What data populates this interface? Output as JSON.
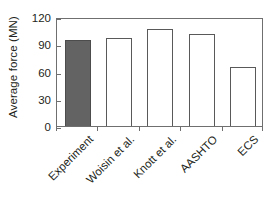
{
  "chart_data": {
    "type": "bar",
    "title": "",
    "subtitle": "",
    "xlabel": "",
    "ylabel": "Average force (MN)",
    "categories": [
      "Experiment",
      "Woisin et al.",
      "Knott et al.",
      "AASHTO",
      "ECS"
    ],
    "values": [
      95,
      97,
      107,
      101,
      65
    ],
    "series": [
      {
        "name": "Average force",
        "values": [
          95,
          97,
          107,
          101,
          65
        ]
      }
    ],
    "ylim": [
      0,
      120
    ],
    "yticks": [
      "0",
      "30",
      "60",
      "90",
      "120"
    ],
    "ytick_values": [
      0,
      30,
      60,
      90,
      120
    ],
    "grid": false,
    "legend": "none",
    "bar_styles": [
      "filled",
      "hollow",
      "hollow",
      "hollow",
      "hollow"
    ],
    "colors": {
      "filled_bar": "#636363",
      "hollow_bar": "#ffffff",
      "bar_outline": "#595959",
      "axis": "#6f6f6f",
      "text": "#231f20",
      "background": "#ffffff"
    },
    "annotations": []
  }
}
